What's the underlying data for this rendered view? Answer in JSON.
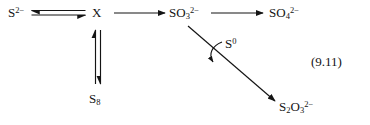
{
  "figure": {
    "kind": "chemical-reaction-scheme",
    "equation_number": "(9.11)",
    "background_color": "#ffffff",
    "ink_color": "#141414"
  },
  "species": {
    "sulfide": {
      "label": "S2-",
      "base": "S",
      "sub": "",
      "sup": "2−"
    },
    "intermediate": {
      "label": "X",
      "base": "X",
      "sub": "",
      "sup": ""
    },
    "sulfite": {
      "label": "SO32-",
      "base": "SO",
      "sub": "3",
      "sup": "2−"
    },
    "sulfate": {
      "label": "SO42-",
      "base": "SO",
      "sub": "4",
      "sup": "2−"
    },
    "sulfur_s8": {
      "label": "S8",
      "base": "S",
      "sub": "8",
      "sup": ""
    },
    "sulfur_zero": {
      "label": "S0",
      "base": "S",
      "sub": "",
      "sup": "0"
    },
    "thiosulfate": {
      "label": "S2O32-",
      "base": "S",
      "sub": "2",
      "sup": "",
      "base2": "O",
      "sub2": "3",
      "sup2": "2−"
    }
  },
  "reactions": [
    {
      "name": "sulfide-intermediate-equilibrium",
      "from": "sulfide",
      "to": "intermediate",
      "arrow": "equilibrium-horizontal"
    },
    {
      "name": "intermediate-to-sulfite",
      "from": "intermediate",
      "to": "sulfite",
      "arrow": "single-right"
    },
    {
      "name": "sulfite-to-sulfate",
      "from": "sulfite",
      "to": "sulfate",
      "arrow": "single-right"
    },
    {
      "name": "intermediate-s8-equilibrium",
      "from": "intermediate",
      "to": "sulfur_s8",
      "arrow": "equilibrium-vertical"
    },
    {
      "name": "sulfite-to-thiosulfate",
      "from": "sulfite",
      "to": "thiosulfate",
      "arrow": "single-diagonal"
    },
    {
      "name": "elemental-sulfur-addition",
      "from": "sulfur_zero",
      "to": "sulfite-to-thiosulfate",
      "arrow": "curved-input"
    }
  ]
}
